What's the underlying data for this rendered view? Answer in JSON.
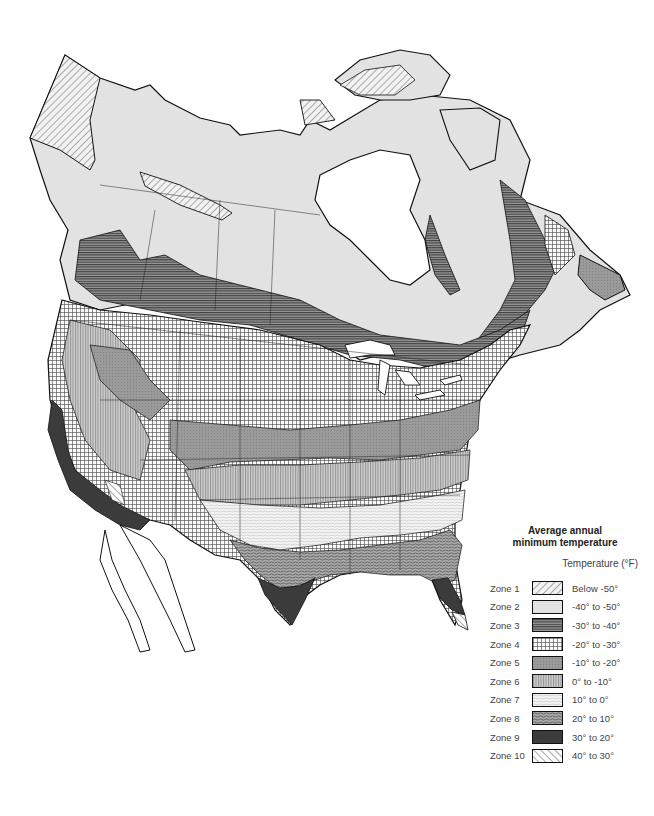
{
  "legend": {
    "title_line1": "Average annual",
    "title_line2": "minimum temperature",
    "unit_label": "Temperature  (°F)",
    "zones": [
      {
        "zone": "Zone 1",
        "range": "Below -50°",
        "pattern": "diag-light"
      },
      {
        "zone": "Zone 2",
        "range": "-40° to -50°",
        "pattern": "light-gray"
      },
      {
        "zone": "Zone 3",
        "range": "-30° to -40°",
        "pattern": "horizontal-lines"
      },
      {
        "zone": "Zone 4",
        "range": "-20° to -30°",
        "pattern": "grid"
      },
      {
        "zone": "Zone 5",
        "range": "-10° to -20°",
        "pattern": "dot-gray"
      },
      {
        "zone": "Zone 6",
        "range": "0° to -10°",
        "pattern": "vertical-lines"
      },
      {
        "zone": "Zone 7",
        "range": "10° to 0°",
        "pattern": "wavy-light"
      },
      {
        "zone": "Zone 8",
        "range": "20° to 10°",
        "pattern": "wavy-dark"
      },
      {
        "zone": "Zone 9",
        "range": "30° to 20°",
        "pattern": "dark-solid"
      },
      {
        "zone": "Zone 10",
        "range": "40° to 30°",
        "pattern": "diag-back"
      }
    ]
  },
  "colors": {
    "zone2_fill": "#e3e3e3",
    "zone3_fill": "#8a8a8a",
    "zone5_fill": "#9a9a9a",
    "zone6_fill": "#bdbdbd",
    "zone8_fill": "#a6a6a6",
    "zone9_fill": "#3c3c3c",
    "outline": "#111111"
  }
}
